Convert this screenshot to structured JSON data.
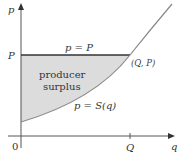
{
  "diagram": {
    "title": "Producer surplus",
    "axes": {
      "y_label": "p",
      "x_label": "q",
      "origin_label": "0",
      "y_tick_label": "P",
      "x_tick_label": "Q"
    },
    "price_line_label": "p = P",
    "point_label": "(Q, P)",
    "curve_label": "p = S(q)",
    "region_label_line1": "producer",
    "region_label_line2": "surplus",
    "colors": {
      "axis": "#555555",
      "curve": "#888888",
      "price_line": "#333333",
      "shade": "#dddddd",
      "text": "#333333"
    }
  }
}
